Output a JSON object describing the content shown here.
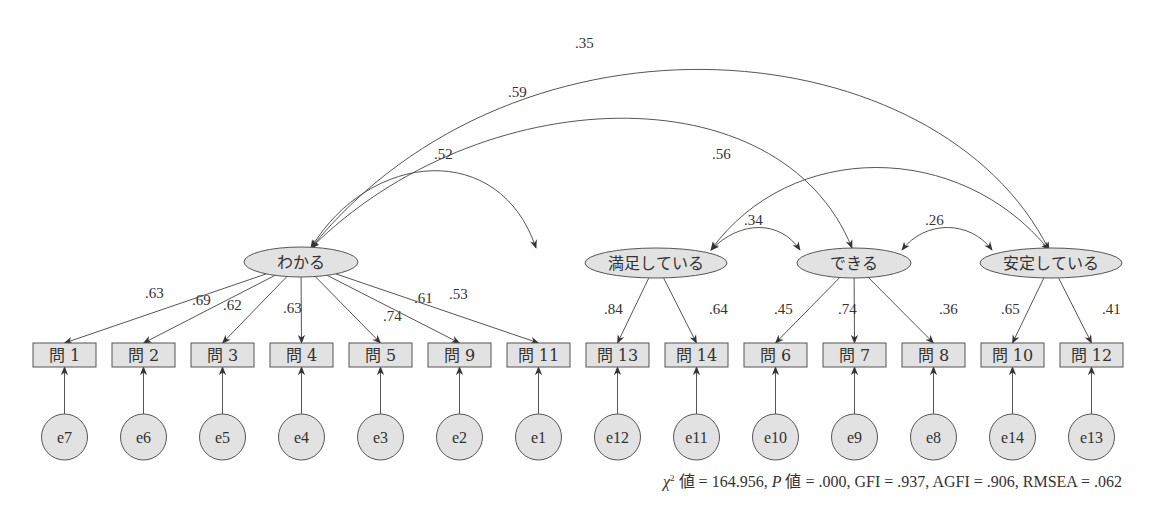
{
  "diagram": {
    "type": "structural-equation-model",
    "colors": {
      "fill": "#e2e2e2",
      "stroke": "#555555",
      "text": "#333333"
    },
    "latent_factors": [
      {
        "id": "wakaru",
        "label": "わかる",
        "cx": 301,
        "cy": 262,
        "rx": 57,
        "ry": 15
      },
      {
        "id": "manzoku",
        "label": "満足している",
        "cx": 656,
        "cy": 263,
        "rx": 71,
        "ry": 15
      },
      {
        "id": "dekiru",
        "label": "できる",
        "cx": 854,
        "cy": 263,
        "rx": 57,
        "ry": 15
      },
      {
        "id": "antei",
        "label": "安定している",
        "cx": 1051,
        "cy": 263,
        "rx": 71,
        "ry": 15
      }
    ],
    "observed": [
      {
        "label": "問 1",
        "x": 33,
        "factor": "wakaru",
        "loading": ".63",
        "lx": 145,
        "ly": 298
      },
      {
        "label": "問 2",
        "x": 112,
        "factor": "wakaru",
        "loading": ".69",
        "lx": 192,
        "ly": 305
      },
      {
        "label": "問 3",
        "x": 191,
        "factor": "wakaru",
        "loading": ".62",
        "lx": 223,
        "ly": 310
      },
      {
        "label": "問 4",
        "x": 270,
        "factor": "wakaru",
        "loading": ".63",
        "lx": 283,
        "ly": 313
      },
      {
        "label": "問 5",
        "x": 349,
        "factor": "wakaru",
        "loading": ".74",
        "lx": 383,
        "ly": 321
      },
      {
        "label": "問 9",
        "x": 428,
        "factor": "wakaru",
        "loading": ".61",
        "lx": 414,
        "ly": 303
      },
      {
        "label": "問 11",
        "x": 507,
        "factor": "wakaru",
        "loading": ".53",
        "lx": 449,
        "ly": 299
      },
      {
        "label": "問 13",
        "x": 586,
        "factor": "manzoku",
        "loading": ".84",
        "lx": 604,
        "ly": 314
      },
      {
        "label": "問 14",
        "x": 665,
        "factor": "manzoku",
        "loading": ".64",
        "lx": 709,
        "ly": 314
      },
      {
        "label": "問 6",
        "x": 744,
        "factor": "dekiru",
        "loading": ".45",
        "lx": 774,
        "ly": 314
      },
      {
        "label": "問 7",
        "x": 823,
        "factor": "dekiru",
        "loading": ".74",
        "lx": 838,
        "ly": 314
      },
      {
        "label": "問 8",
        "x": 902,
        "factor": "dekiru",
        "loading": ".36",
        "lx": 939,
        "ly": 314
      },
      {
        "label": "問 10",
        "x": 981,
        "factor": "antei",
        "loading": ".65",
        "lx": 1001,
        "ly": 314
      },
      {
        "label": "問 12",
        "x": 1060,
        "factor": "antei",
        "loading": ".41",
        "lx": 1102,
        "ly": 314
      }
    ],
    "errors": [
      "e7",
      "e6",
      "e5",
      "e4",
      "e3",
      "e2",
      "e1",
      "e12",
      "e11",
      "e10",
      "e9",
      "e8",
      "e14",
      "e13"
    ],
    "correlations": [
      {
        "from": "wakaru",
        "to": "antei",
        "value": ".35",
        "path": "M 1049 250 C 940 30, 520 -10, 311 248",
        "lx": 575,
        "ly": 48
      },
      {
        "from": "wakaru",
        "to": "dekiru",
        "value": ".59",
        "path": "M 852 248 C 780 70, 480 80, 311 248",
        "lx": 508,
        "ly": 97
      },
      {
        "from": "wakaru",
        "to": "manzoku",
        "value": ".52",
        "path": "M 536 248 C 500 140, 370 150, 311 248",
        "lx": 434,
        "ly": 159
      },
      {
        "from": "manzoku",
        "to": "antei",
        "value": ".56",
        "path": "M 1049 250 C 960 140, 790 140, 711 250",
        "lx": 712,
        "ly": 159
      },
      {
        "from": "manzoku",
        "to": "dekiru",
        "value": ".34",
        "path": "M 800 250 C 780 220, 740 220, 711 250",
        "lx": 744,
        "ly": 225
      },
      {
        "from": "dekiru",
        "to": "antei",
        "value": ".26",
        "path": "M 992 250 C 970 220, 925 220, 902 250",
        "lx": 925,
        "ly": 225
      }
    ],
    "fit_indices": {
      "chi_symbol": "χ",
      "chi_sup": "2",
      "chi_label": " 値 = 164.956,  ",
      "p_symbol": "P",
      "p_label": " 値 = .000,  ",
      "rest": "GFI = .937,  AGFI = .906,  RMSEA = .062"
    }
  }
}
